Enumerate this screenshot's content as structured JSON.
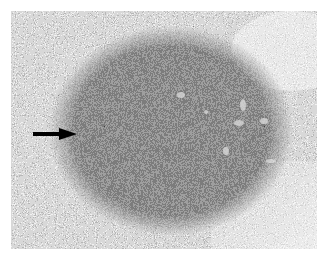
{
  "image": {
    "kind": "grayscale histology micrograph",
    "subject": "dense rounded aggregate of small dark cells (lymphoid follicle) surrounded by looser lighter tissue",
    "annotation": {
      "type": "arrow",
      "color": "#000000",
      "direction": "pointing right",
      "position_px": {
        "x1": 33,
        "y1": 133,
        "x2": 75,
        "y2": 135
      }
    },
    "colors": {
      "background": "#ffffff",
      "follicle": "#2e2e2e",
      "surrounding_tissue": "#b8b8b8",
      "light_region": "#e0e0e0"
    }
  }
}
